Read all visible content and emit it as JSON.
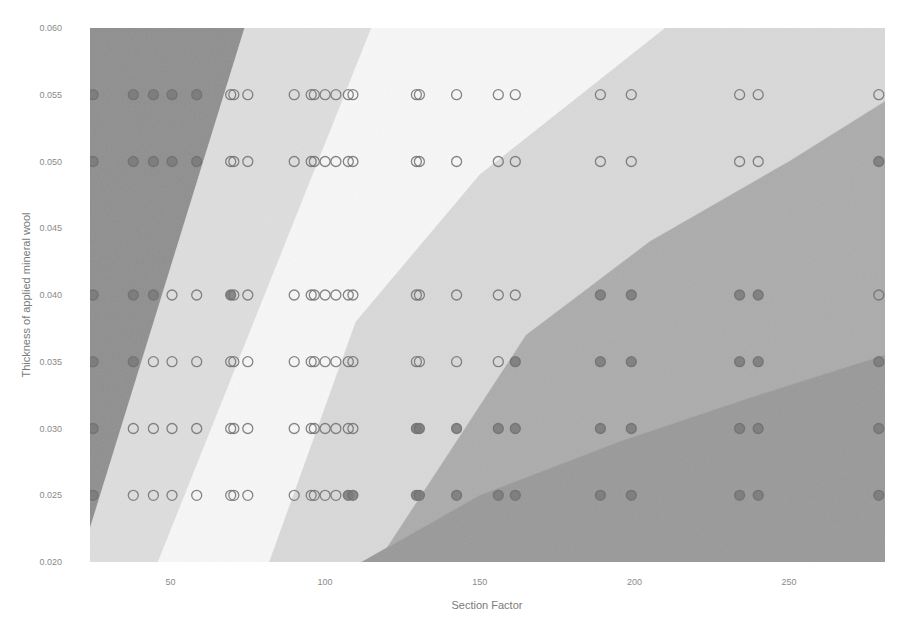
{
  "chart_data": {
    "type": "scatter",
    "title": "",
    "xlabel": "Section Factor",
    "ylabel": "Thickness of applied mineral wool",
    "xlim": [
      24,
      281
    ],
    "ylim": [
      0.02,
      0.06
    ],
    "grid": false,
    "legend": "none",
    "x_ticks": [
      {
        "value": 50,
        "label": "50"
      },
      {
        "value": 100,
        "label": "100"
      },
      {
        "value": 150,
        "label": "150"
      },
      {
        "value": 200,
        "label": "200"
      },
      {
        "value": 250,
        "label": "250"
      }
    ],
    "y_ticks": [
      {
        "value": 0.02,
        "label": "0.020"
      },
      {
        "value": 0.025,
        "label": "0.025"
      },
      {
        "value": 0.03,
        "label": "0.030"
      },
      {
        "value": 0.035,
        "label": "0.035"
      },
      {
        "value": 0.04,
        "label": "0.040"
      },
      {
        "value": 0.045,
        "label": "0.045"
      },
      {
        "value": 0.05,
        "label": "0.050"
      },
      {
        "value": 0.055,
        "label": "0.055"
      },
      {
        "value": 0.06,
        "label": "0.060"
      }
    ],
    "decision_regions": [
      {
        "name": "region-1",
        "color": "#8f8f8f",
        "polygon": [
          [
            24,
            0.06
          ],
          [
            74,
            0.06
          ],
          [
            24,
            0.0225
          ]
        ]
      },
      {
        "name": "region-2",
        "color": "#dedede",
        "polygon": [
          [
            74,
            0.06
          ],
          [
            115,
            0.06
          ],
          [
            46,
            0.02
          ],
          [
            24,
            0.02
          ],
          [
            24,
            0.0225
          ]
        ]
      },
      {
        "name": "region-3",
        "color": "#f7f7f7",
        "polygon": [
          [
            115,
            0.06
          ],
          [
            210,
            0.06
          ],
          [
            150,
            0.049
          ],
          [
            110,
            0.038
          ],
          [
            82,
            0.02
          ],
          [
            46,
            0.02
          ]
        ]
      },
      {
        "name": "region-4",
        "color": "#d9d9d9",
        "polygon": [
          [
            210,
            0.06
          ],
          [
            281,
            0.06
          ],
          [
            281,
            0.0545
          ],
          [
            250,
            0.05
          ],
          [
            205,
            0.044
          ],
          [
            165,
            0.037
          ],
          [
            117,
            0.02
          ],
          [
            82,
            0.02
          ],
          [
            110,
            0.038
          ],
          [
            150,
            0.049
          ]
        ]
      },
      {
        "name": "region-5",
        "color": "#acacac",
        "polygon": [
          [
            281,
            0.0545
          ],
          [
            281,
            0.0355
          ],
          [
            240,
            0.0325
          ],
          [
            195,
            0.029
          ],
          [
            150,
            0.025
          ],
          [
            112,
            0.02
          ],
          [
            117,
            0.02
          ],
          [
            165,
            0.037
          ],
          [
            205,
            0.044
          ],
          [
            250,
            0.05
          ]
        ]
      },
      {
        "name": "region-6",
        "color": "#9a9a9a",
        "polygon": [
          [
            281,
            0.0355
          ],
          [
            281,
            0.02
          ],
          [
            112,
            0.02
          ],
          [
            150,
            0.025
          ],
          [
            195,
            0.029
          ],
          [
            240,
            0.0325
          ]
        ]
      }
    ],
    "series": [
      {
        "name": "thickness-0.055",
        "y": 0.055,
        "x": [
          25,
          38,
          44.5,
          50.5,
          58.5,
          69.5,
          70.5,
          75,
          90,
          95.5,
          96.5,
          100,
          103.5,
          107.5,
          109,
          129.5,
          130.5,
          142.5,
          156,
          161.5,
          189,
          199,
          234,
          240,
          279
        ],
        "filled": [
          1,
          1,
          1,
          1,
          1,
          0,
          0,
          0,
          0,
          0,
          0,
          0,
          0,
          0,
          0,
          0,
          0,
          0,
          0,
          0,
          0,
          0,
          0,
          0,
          0
        ]
      },
      {
        "name": "thickness-0.050",
        "y": 0.05,
        "x": [
          25,
          38,
          44.5,
          50.5,
          58.5,
          69.5,
          70.5,
          75,
          90,
          95.5,
          96.5,
          100,
          103.5,
          107.5,
          109,
          129.5,
          130.5,
          142.5,
          156,
          161.5,
          189,
          199,
          234,
          240,
          279
        ],
        "filled": [
          1,
          1,
          1,
          1,
          1,
          0,
          0,
          0,
          0,
          0,
          0,
          0,
          0,
          0,
          0,
          0,
          0,
          0,
          0,
          0,
          0,
          0,
          0,
          0,
          1
        ]
      },
      {
        "name": "thickness-0.040",
        "y": 0.04,
        "x": [
          25,
          38,
          44.5,
          50.5,
          58.5,
          69.5,
          70.5,
          75,
          90,
          95.5,
          96.5,
          100,
          103.5,
          107.5,
          109,
          129.5,
          130.5,
          142.5,
          156,
          161.5,
          189,
          199,
          234,
          240,
          279
        ],
        "filled": [
          1,
          1,
          1,
          0,
          0,
          1,
          0,
          0,
          0,
          0,
          0,
          0,
          0,
          0,
          0,
          0,
          0,
          0,
          0,
          0,
          1,
          1,
          1,
          1,
          0
        ]
      },
      {
        "name": "thickness-0.035",
        "y": 0.035,
        "x": [
          25,
          38,
          44.5,
          50.5,
          58.5,
          69.5,
          70.5,
          75,
          90,
          95.5,
          96.5,
          100,
          103.5,
          107.5,
          109,
          129.5,
          130.5,
          142.5,
          156,
          161.5,
          189,
          199,
          234,
          240,
          279
        ],
        "filled": [
          1,
          1,
          0,
          0,
          0,
          0,
          0,
          0,
          0,
          0,
          0,
          0,
          0,
          0,
          0,
          0,
          0,
          0,
          0,
          1,
          1,
          1,
          1,
          1,
          1
        ]
      },
      {
        "name": "thickness-0.030",
        "y": 0.03,
        "x": [
          25,
          38,
          44.5,
          50.5,
          58.5,
          69.5,
          70.5,
          75,
          90,
          95.5,
          96.5,
          100,
          103.5,
          107.5,
          109,
          129.5,
          130.5,
          142.5,
          156,
          161.5,
          189,
          199,
          234,
          240,
          279
        ],
        "filled": [
          1,
          0,
          0,
          0,
          0,
          0,
          0,
          0,
          0,
          0,
          0,
          0,
          0,
          0,
          0,
          1,
          1,
          1,
          1,
          1,
          1,
          1,
          1,
          1,
          1
        ]
      },
      {
        "name": "thickness-0.025",
        "y": 0.025,
        "x": [
          25,
          38,
          44.5,
          50.5,
          58.5,
          69.5,
          70.5,
          75,
          90,
          95.5,
          96.5,
          100,
          103.5,
          107.5,
          109,
          129.5,
          130.5,
          142.5,
          156,
          161.5,
          189,
          199,
          234,
          240,
          279
        ],
        "filled": [
          1,
          0,
          0,
          0,
          0,
          0,
          0,
          0,
          0,
          0,
          0,
          0,
          0,
          1,
          1,
          1,
          1,
          1,
          1,
          1,
          1,
          1,
          1,
          1,
          1
        ]
      }
    ],
    "marker_colors": {
      "filled_fill": "#7a7a7a",
      "open_fill": "none",
      "stroke": "#707070"
    }
  }
}
